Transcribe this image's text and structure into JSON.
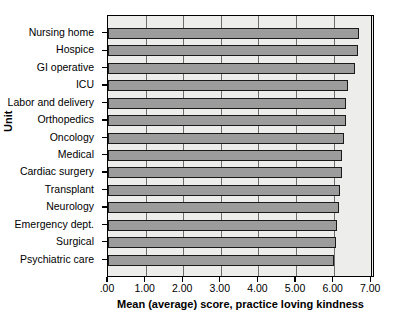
{
  "chart_data": {
    "type": "bar",
    "orientation": "horizontal",
    "title": "",
    "xlabel": "Mean (average) score, practice loving kindness",
    "ylabel": "Unit",
    "xlim": [
      0,
      7.1
    ],
    "xticks": [
      ".00",
      "1.00",
      "2.00",
      "3.00",
      "4.00",
      "5.00",
      "6.00",
      "7.00"
    ],
    "xtick_values": [
      0,
      1,
      2,
      3,
      4,
      5,
      6,
      7
    ],
    "grid": true,
    "legend": "none",
    "categories": [
      "Nursing home",
      "Hospice",
      "GI operative",
      "ICU",
      "Labor and delivery",
      "Orthopedics",
      "Oncology",
      "Medical",
      "Cardiac surgery",
      "Transplant",
      "Neurology",
      "Emergency dept.",
      "Surgical",
      "Psychiatric care"
    ],
    "values": [
      6.68,
      6.65,
      6.58,
      6.39,
      6.34,
      6.33,
      6.28,
      6.23,
      6.21,
      6.18,
      6.14,
      6.09,
      6.05,
      6.02
    ],
    "bar_color": "#9c9c9c",
    "bar_edge_color": "#1a1a1a",
    "plot_background": "#ededeb"
  }
}
